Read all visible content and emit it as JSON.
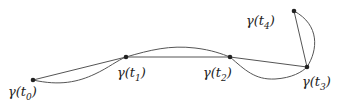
{
  "diagram": {
    "type": "curve-approximation",
    "colors": {
      "line": "#555555",
      "point": "#222222",
      "background": "#ffffff"
    },
    "points": [
      {
        "id": "t0",
        "x": 33,
        "y": 80,
        "label_base": "γ(t",
        "label_sub": "0",
        "label_close": ")",
        "label_x": 8,
        "label_y": 85
      },
      {
        "id": "t1",
        "x": 126,
        "y": 57,
        "label_base": "γ(t",
        "label_sub": "1",
        "label_close": ")",
        "label_x": 117,
        "label_y": 66
      },
      {
        "id": "t2",
        "x": 230,
        "y": 57,
        "label_base": "γ(t",
        "label_sub": "2",
        "label_close": ")",
        "label_x": 203,
        "label_y": 66
      },
      {
        "id": "t3",
        "x": 307,
        "y": 67,
        "label_base": "γ(t",
        "label_sub": "3",
        "label_close": ")",
        "label_x": 302,
        "label_y": 75
      },
      {
        "id": "t4",
        "x": 294,
        "y": 11,
        "label_base": "γ(t",
        "label_sub": "4",
        "label_close": ")",
        "label_x": 246,
        "label_y": 14
      }
    ],
    "chords": [
      {
        "from": "t0",
        "to": "t1"
      },
      {
        "from": "t1",
        "to": "t2"
      },
      {
        "from": "t2",
        "to": "t3"
      },
      {
        "from": "t3",
        "to": "t4"
      }
    ],
    "curve_segments": [
      {
        "from": "t0",
        "to": "t1",
        "path": "M33,80 C60,86 78,82 95,74 C108,68 118,60 126,57"
      },
      {
        "from": "t1",
        "to": "t2",
        "path": "M126,57 C150,50 170,45 195,48 C212,50 222,54 230,57"
      },
      {
        "from": "t2",
        "to": "t3",
        "path": "M230,57 C245,70 255,80 275,79 C292,78 302,72 307,67"
      },
      {
        "from": "t3",
        "to": "t4",
        "path": "M307,67 C318,50 320,25 294,11"
      }
    ]
  }
}
